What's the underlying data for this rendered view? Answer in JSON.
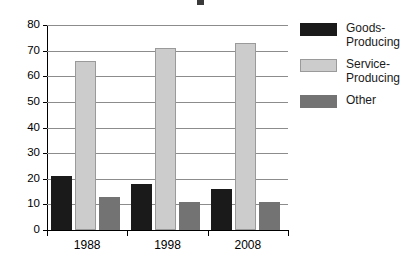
{
  "chart_data": {
    "type": "bar",
    "title": "",
    "xlabel": "",
    "ylabel": "",
    "categories": [
      "1988",
      "1998",
      "2008"
    ],
    "series": [
      {
        "name": "Goods-Producing",
        "color": "#1a1a1a",
        "values": [
          21,
          18,
          16
        ]
      },
      {
        "name": "Service-Producing",
        "color": "#cccccc",
        "values": [
          66,
          71,
          73
        ]
      },
      {
        "name": "Other",
        "color": "#737373",
        "values": [
          13,
          11,
          11
        ]
      }
    ],
    "ylim": [
      0,
      80
    ],
    "ytick_values": [
      0,
      10,
      20,
      30,
      40,
      50,
      60,
      70,
      80
    ],
    "ytick_labels": [
      "0",
      "10",
      "20",
      "30",
      "40",
      "50",
      "60",
      "70",
      "80"
    ],
    "grid": true,
    "legend_position": "right"
  },
  "legend": {
    "items": [
      {
        "label": "Goods-\nProducing",
        "swatch": "goods"
      },
      {
        "label": "Service-\nProducing",
        "swatch": "service"
      },
      {
        "label": "Other",
        "swatch": "other"
      }
    ]
  },
  "axes": {
    "y_max": 80,
    "y_min": 0
  }
}
